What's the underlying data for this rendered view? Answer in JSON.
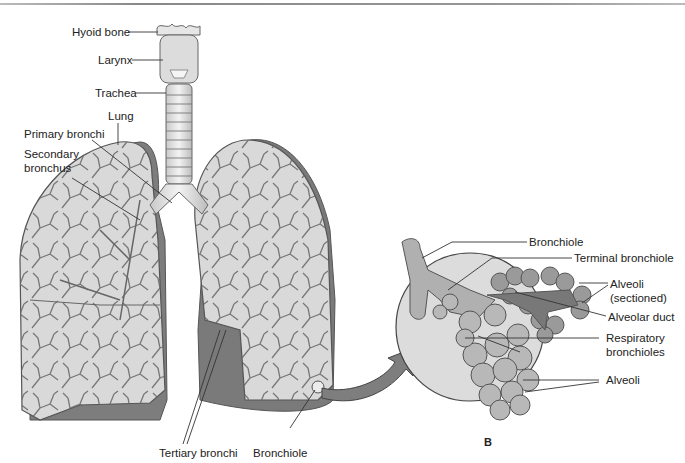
{
  "figure": {
    "panel_a_labels": {
      "hyoid_bone": "Hyoid bone",
      "larynx": "Larynx",
      "trachea": "Trachea",
      "lung": "Lung",
      "primary_bronchi": "Primary bronchi",
      "secondary_bronchus_line1": "Secondary",
      "secondary_bronchus_line2": "bronchus",
      "tertiary_bronchi": "Tertiary bronchi",
      "bronchiole": "Bronchiole"
    },
    "panel_b_labels": {
      "bronchiole": "Bronchiole",
      "terminal_bronchiole": "Terminal bronchiole",
      "alveoli_sectioned_line1": "Alveoli",
      "alveoli_sectioned_line2": "(sectioned)",
      "alveolar_duct": "Alveolar duct",
      "respiratory_bronchioles_line1": "Respiratory",
      "respiratory_bronchioles_line2": "bronchioles",
      "alveoli": "Alveoli"
    },
    "panel_b_letter": "B",
    "colors": {
      "lung_fill": "#d9d9d9",
      "lung_shadow": "#7a7a7a",
      "airway_line": "#555555",
      "magnifier_circle": "#dcdcdc",
      "alveoli_fill": "#b5b5b5",
      "sectioned_fill": "#7d7d7d",
      "arrow_fill": "#7e7e7e"
    }
  }
}
